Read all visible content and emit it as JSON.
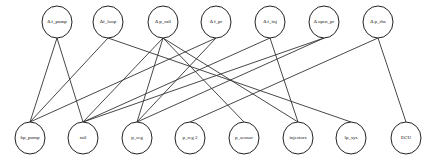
{
  "diagram": {
    "type": "bipartite-graph",
    "top_nodes": [
      {
        "id": "df_pump",
        "label": "Δ f_pump",
        "x": 57,
        "y": 22
      },
      {
        "id": "df_loop",
        "label": "Δf_loop",
        "x": 108,
        "y": 22
      },
      {
        "id": "dp_rail",
        "label": "Δ p_rail",
        "x": 163,
        "y": 22
      },
      {
        "id": "df_pr",
        "label": "Δ f_pr",
        "x": 216,
        "y": 22
      },
      {
        "id": "df_inj",
        "label": "Δ f_inj",
        "x": 270,
        "y": 22
      },
      {
        "id": "dopen_pr",
        "label": "Δ open_pr",
        "x": 324,
        "y": 22
      },
      {
        "id": "dp_rbs",
        "label": "Δ p_rbs",
        "x": 378,
        "y": 22
      }
    ],
    "bottom_nodes": [
      {
        "id": "hp_pump",
        "label": "hp_pump",
        "x": 30,
        "y": 138
      },
      {
        "id": "rail",
        "label": "rail",
        "x": 83,
        "y": 138
      },
      {
        "id": "p_reg",
        "label": "p_reg",
        "x": 137,
        "y": 138
      },
      {
        "id": "p_reg2",
        "label": "p_reg 2",
        "x": 190,
        "y": 138
      },
      {
        "id": "p_sensor",
        "label": "p_sensor",
        "x": 244,
        "y": 138
      },
      {
        "id": "injectors",
        "label": "injectors",
        "x": 298,
        "y": 138
      },
      {
        "id": "lp_sys",
        "label": "lp_sys",
        "x": 351,
        "y": 138
      },
      {
        "id": "ECU",
        "label": "ECU",
        "x": 406,
        "y": 138
      }
    ],
    "edges": [
      [
        "df_pump",
        "hp_pump"
      ],
      [
        "df_pump",
        "rail"
      ],
      [
        "df_loop",
        "hp_pump"
      ],
      [
        "df_loop",
        "lp_sys"
      ],
      [
        "dp_rail",
        "rail"
      ],
      [
        "dp_rail",
        "p_reg"
      ],
      [
        "dp_rail",
        "p_sensor"
      ],
      [
        "dp_rail",
        "injectors"
      ],
      [
        "df_pr",
        "hp_pump"
      ],
      [
        "df_pr",
        "p_reg"
      ],
      [
        "df_inj",
        "rail"
      ],
      [
        "df_inj",
        "injectors"
      ],
      [
        "dopen_pr",
        "rail"
      ],
      [
        "dopen_pr",
        "p_reg"
      ],
      [
        "dp_rbs",
        "p_reg2"
      ],
      [
        "dp_rbs",
        "ECU"
      ]
    ],
    "node_radius_x": 15,
    "node_radius_y": 16
  }
}
